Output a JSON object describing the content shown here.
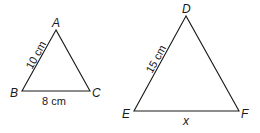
{
  "triangles": [
    {
      "vertices": {
        "A": "A",
        "B": "B",
        "C": "C"
      },
      "sides": {
        "AB": "10 cm",
        "BC": "8 cm"
      }
    },
    {
      "vertices": {
        "D": "D",
        "E": "E",
        "F": "F"
      },
      "sides": {
        "DE": "15 cm",
        "EF": "x"
      }
    }
  ],
  "colors": {
    "stroke": "#1a1a1a",
    "background": "#ffffff"
  }
}
